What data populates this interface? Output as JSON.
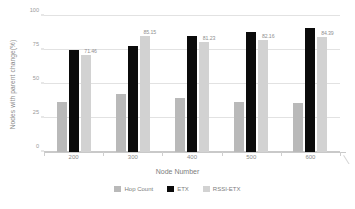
{
  "chart_data": {
    "type": "bar",
    "title": "",
    "subtitle": "",
    "xlabel": "Node Number",
    "ylabel": "Nodes with parent change(%)",
    "categories": [
      "200",
      "300",
      "400",
      "500",
      "600"
    ],
    "series": [
      {
        "name": "Hop Count",
        "color": "#b9b9b9",
        "values": [
          37,
          43,
          40,
          37,
          36
        ],
        "labels": [
          "",
          "",
          "",
          "",
          ""
        ]
      },
      {
        "name": "ETX",
        "color": "#0b0b0b",
        "values": [
          75,
          78,
          85,
          88,
          91
        ],
        "labels": [
          "",
          "",
          "",
          "",
          ""
        ]
      },
      {
        "name": "RSSI-ETX",
        "color": "#d2d2d2",
        "values": [
          71.46,
          85.15,
          81.23,
          82.16,
          84.39
        ],
        "labels": [
          "71.46",
          "85.15",
          "81.23",
          "82.16",
          "84.39"
        ]
      }
    ],
    "ylim": [
      0,
      100
    ],
    "yticks": [
      0,
      25,
      50,
      75,
      100
    ],
    "ytick_labels": [
      "0",
      "25",
      "50",
      "75",
      "100"
    ],
    "grid": "horizontal",
    "legend_position": "bottom"
  },
  "legend": {
    "items": [
      {
        "label": "Hop Count",
        "color": "#b9b9b9"
      },
      {
        "label": "ETX",
        "color": "#0b0b0b"
      },
      {
        "label": "RSSI-ETX",
        "color": "#d2d2d2"
      }
    ]
  }
}
